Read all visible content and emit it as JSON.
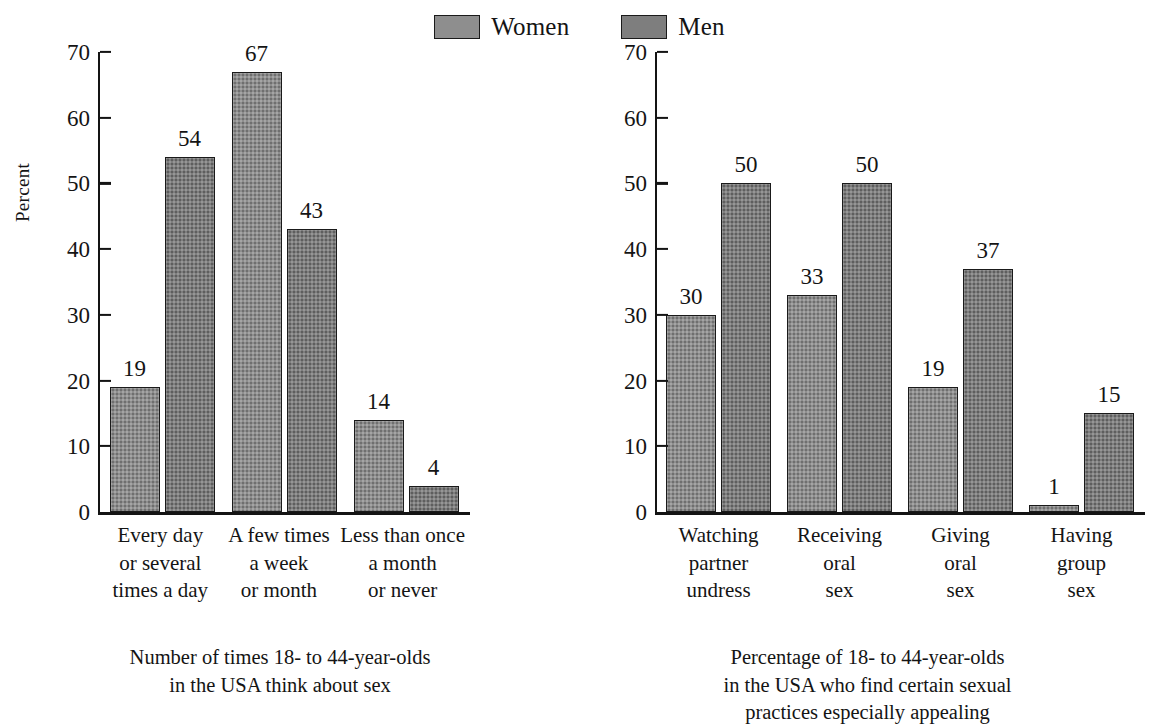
{
  "legend": {
    "items": [
      {
        "label": "Women",
        "key": "women",
        "color": "#8e8e8e"
      },
      {
        "label": "Men",
        "key": "men",
        "color": "#7e7e7e"
      }
    ]
  },
  "chart_data": [
    {
      "id": "left",
      "type": "bar",
      "title": "",
      "xlabel": "",
      "ylabel": "Percent",
      "ylim": [
        0,
        70
      ],
      "yticks": [
        0,
        10,
        20,
        30,
        40,
        50,
        60,
        70
      ],
      "grid": false,
      "legend_position": "top-center",
      "categories": [
        "Every day or several times a day",
        "A few times a week or month",
        "Less than once a month or never"
      ],
      "category_lines": [
        [
          "Every day",
          "or several",
          "times a day"
        ],
        [
          "A few times",
          "a week",
          "or month"
        ],
        [
          "Less than once",
          "a month",
          "or never"
        ]
      ],
      "series": [
        {
          "name": "Women",
          "values": [
            19,
            67,
            14
          ]
        },
        {
          "name": "Men",
          "values": [
            54,
            43,
            4
          ]
        }
      ],
      "caption_lines": [
        "Number of times 18- to 44-year-olds",
        "in the USA think about sex"
      ]
    },
    {
      "id": "right",
      "type": "bar",
      "title": "",
      "xlabel": "",
      "ylabel": "",
      "ylim": [
        0,
        70
      ],
      "yticks": [
        0,
        10,
        20,
        30,
        40,
        50,
        60,
        70
      ],
      "grid": false,
      "legend_position": "top-center",
      "categories": [
        "Watching partner undress",
        "Receiving oral sex",
        "Giving oral sex",
        "Having group sex"
      ],
      "category_lines": [
        [
          "Watching",
          "partner",
          "undress"
        ],
        [
          "Receiving",
          "oral",
          "sex"
        ],
        [
          "Giving",
          "oral",
          "sex"
        ],
        [
          "Having",
          "group",
          "sex"
        ]
      ],
      "series": [
        {
          "name": "Women",
          "values": [
            30,
            33,
            19,
            1
          ]
        },
        {
          "name": "Men",
          "values": [
            50,
            50,
            37,
            15
          ]
        }
      ],
      "caption_lines": [
        "Percentage of 18- to 44-year-olds",
        "in the USA who find certain sexual",
        "practices especially appealing"
      ]
    }
  ]
}
